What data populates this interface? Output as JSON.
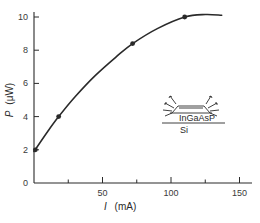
{
  "chart_data": {
    "type": "line",
    "title": "",
    "xlabel": "I (mA)",
    "ylabel": "P (μW)",
    "xlabel_symbol": "I",
    "xlabel_unit": "(mA)",
    "ylabel_symbol": "P",
    "ylabel_unit": "(μW)",
    "xlim": [
      0,
      160
    ],
    "ylim": [
      0,
      10.5
    ],
    "x_ticks": [
      50,
      100,
      150
    ],
    "x_minor_ticks": [
      25,
      75,
      125
    ],
    "y_ticks": [
      0,
      2,
      4,
      6,
      8,
      10
    ],
    "grid": false,
    "legend": null,
    "series": [
      {
        "name": "InGaAsP LED on Si",
        "markers": [
          {
            "x": 1,
            "y": 2.0
          },
          {
            "x": 18,
            "y": 4.0
          },
          {
            "x": 72,
            "y": 8.4
          },
          {
            "x": 110,
            "y": 10.0
          }
        ],
        "curve": [
          {
            "x": 0,
            "y": 1.9
          },
          {
            "x": 10,
            "y": 3.1
          },
          {
            "x": 18,
            "y": 4.0
          },
          {
            "x": 30,
            "y": 5.2
          },
          {
            "x": 45,
            "y": 6.5
          },
          {
            "x": 60,
            "y": 7.6
          },
          {
            "x": 72,
            "y": 8.4
          },
          {
            "x": 90,
            "y": 9.3
          },
          {
            "x": 110,
            "y": 10.0
          },
          {
            "x": 125,
            "y": 10.15
          },
          {
            "x": 137,
            "y": 10.1
          }
        ]
      }
    ],
    "annotations": [
      {
        "type": "inset-diagram",
        "description": "LED mesa on substrate emitting light",
        "labels": [
          "InGaAsP",
          "Si"
        ]
      }
    ]
  },
  "axes": {
    "x_tick_labels": [
      "50",
      "100",
      "150"
    ],
    "y_tick_labels": [
      "0",
      "2",
      "4",
      "6",
      "8",
      "10"
    ],
    "x_label_symbol": "I",
    "x_label_unit": "(mA)",
    "y_label_symbol": "P",
    "y_label_unit": "(μW)"
  },
  "inset": {
    "layer_label": "InGaAsP",
    "substrate_label": "Si"
  },
  "colors": {
    "ink": "#2a2a2a",
    "background": "#ffffff"
  }
}
